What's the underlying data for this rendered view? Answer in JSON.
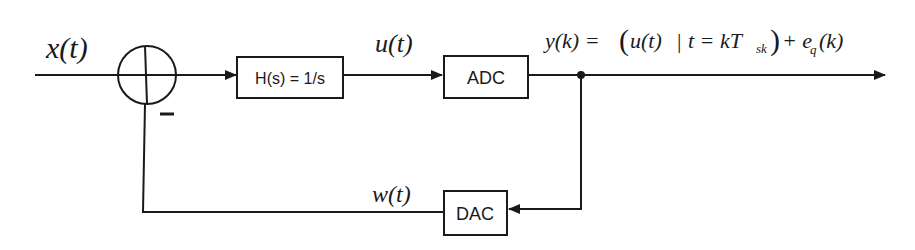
{
  "diagram": {
    "type": "block-diagram",
    "colors": {
      "stroke": "#1a1a1a",
      "background": "#ffffff"
    },
    "signals": {
      "input": "x(t)",
      "integrator_out": "u(t)",
      "feedback": "w(t)",
      "output_lhs": "y(k) =",
      "output_expr": {
        "open": "(",
        "u": "u(t)",
        "bar": "|",
        "t_eq": "t = kT",
        "sub_sk": "sk",
        "close": ")",
        "plus": "+ e",
        "sub_q": "q",
        "k": "(k)"
      }
    },
    "summing_junction": {
      "minus_sign": "–"
    },
    "blocks": {
      "integrator": "H(s) = 1/s",
      "adc": "ADC",
      "dac": "DAC"
    }
  }
}
